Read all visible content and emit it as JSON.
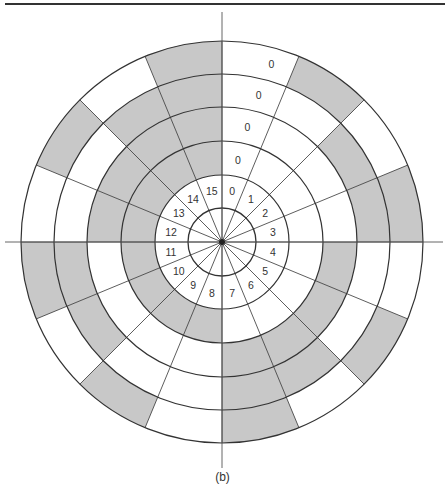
{
  "figure": {
    "caption": "(b)",
    "type": "encoder-disk",
    "code": "natural-binary",
    "sectors": 16,
    "sector_labels": [
      "0",
      "1",
      "2",
      "3",
      "4",
      "5",
      "6",
      "7",
      "8",
      "9",
      "10",
      "11",
      "12",
      "13",
      "14",
      "15"
    ],
    "track_zero_labels": [
      "0",
      "0",
      "0",
      "0"
    ],
    "rings_inner_to_outer": [
      "bit3 (MSB)",
      "bit2",
      "bit1",
      "bit0 (LSB)"
    ],
    "shaded_color": "#c8c8c8",
    "line_color": "#333333"
  },
  "geometry": {
    "cx": 222,
    "cy": 242,
    "hub_radius": 34,
    "label_ring_radius": 67,
    "ring_radii": [
      67,
      101,
      135,
      168,
      201
    ],
    "label_radius": 52,
    "axis_h": [
      5,
      443
    ],
    "axis_v": [
      12,
      468
    ]
  }
}
